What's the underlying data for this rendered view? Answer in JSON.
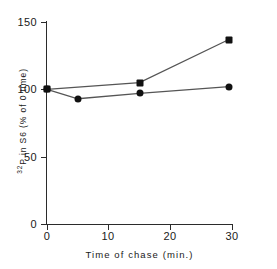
{
  "chart_data": {
    "type": "line",
    "title": "",
    "xlabel": "Time of chase (min.)",
    "ylabel": "32P in S6 (% of 0 time)",
    "ylabel_superscript": "32",
    "ylabel_rest": "P in S6 (% of 0 time)",
    "xlim": [
      0,
      30
    ],
    "ylim": [
      0,
      150
    ],
    "xticks": [
      0,
      10,
      20,
      30
    ],
    "xtick_labels": [
      "0",
      "10",
      "20",
      "30"
    ],
    "yticks": [
      0,
      50,
      100,
      150
    ],
    "ytick_labels": [
      "0",
      "50",
      "100",
      "150"
    ],
    "grid": false,
    "legend": "none",
    "series": [
      {
        "name": "upper-series",
        "marker": "square",
        "color": "#111111",
        "x": [
          0,
          15,
          29.5
        ],
        "y": [
          100,
          105,
          137
        ]
      },
      {
        "name": "lower-series",
        "marker": "circle",
        "color": "#111111",
        "x": [
          0,
          5,
          15,
          29.5
        ],
        "y": [
          100,
          93,
          97,
          102
        ]
      }
    ],
    "line_color": "#555555",
    "axis_color": "#2b2b2b",
    "background": "#ffffff"
  }
}
